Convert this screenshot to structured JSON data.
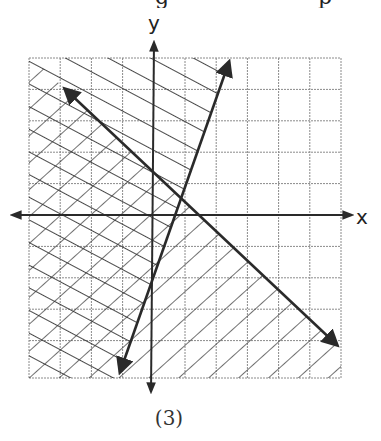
{
  "header_fragment": {
    "text": "g                                   p"
  },
  "graph": {
    "x_axis_label": "x",
    "y_axis_label": "y",
    "grid": {
      "columns": 10,
      "rows": 10,
      "x_min": -4,
      "x_max": 6,
      "y_min": -5,
      "y_max": 5
    },
    "lines": [
      {
        "id": "line-a",
        "equation": "y = 3x - 2",
        "from": [
          -1.1,
          -5
        ],
        "to": [
          2.4,
          5
        ],
        "shade": "left",
        "hatch": "descending"
      },
      {
        "id": "line-b",
        "equation": "y = -x + 2",
        "from": [
          -2.8,
          4
        ],
        "to": [
          5.9,
          -4
        ],
        "shade": "below",
        "hatch": "ascending"
      }
    ],
    "intersection": [
      1,
      1
    ]
  },
  "caption": "(3)",
  "colors": {
    "line": "#2a2a2a",
    "grid": "#7a7a7a",
    "hatch": "#333333"
  }
}
